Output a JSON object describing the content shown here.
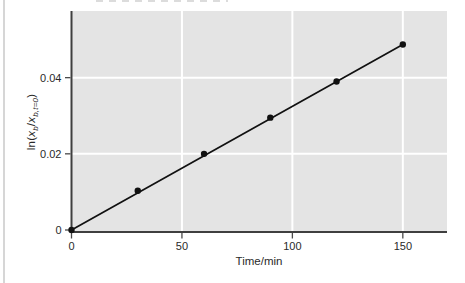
{
  "page": {
    "background": "#ffffff",
    "left_rule_color": "#d6d6d6"
  },
  "chart_data": {
    "type": "scatter",
    "title": "",
    "xlabel": "Time/min",
    "ylabel": "ln(x_b/x_b,t=0)",
    "ylabel_segments": [
      {
        "text": "ln("
      },
      {
        "text": "x",
        "italic": true
      },
      {
        "text": "b",
        "italic": true,
        "sub": true
      },
      {
        "text": "/"
      },
      {
        "text": "x",
        "italic": true
      },
      {
        "text": "b,t=0",
        "italic": true,
        "sub": true
      },
      {
        "text": ")"
      }
    ],
    "x": [
      0,
      30,
      60,
      90,
      120,
      150
    ],
    "y": [
      0,
      0.0103,
      0.02,
      0.0295,
      0.039,
      0.0487
    ],
    "fit_line": {
      "x": [
        0,
        150
      ],
      "y": [
        0,
        0.0487
      ]
    },
    "xlim": [
      0,
      170
    ],
    "ylim": [
      0,
      0.0575
    ],
    "xticks": [
      0,
      50,
      100,
      150
    ],
    "xtick_labels": [
      "0",
      "50",
      "100",
      "150"
    ],
    "yticks": [
      0,
      0.02,
      0.04
    ],
    "ytick_labels": [
      "0",
      "0.02",
      "0.04"
    ],
    "grid": true,
    "legend": null,
    "colors": {
      "plot_bg": "#e4e4e4",
      "grid": "#ffffff",
      "axis": "#3f3f3f",
      "tick": "#4a4a4a",
      "line": "#111111",
      "point": "#111111",
      "text": "#2a2a2a"
    }
  }
}
